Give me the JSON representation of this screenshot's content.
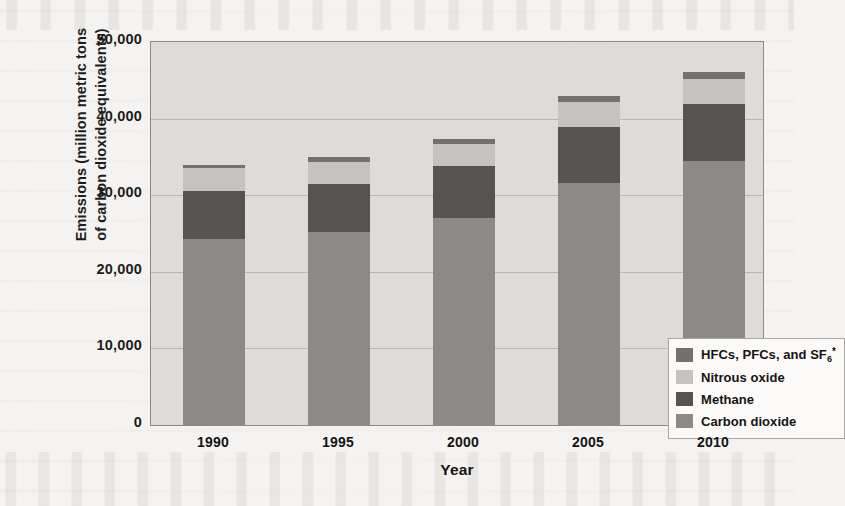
{
  "chart_data": {
    "type": "bar",
    "subtype": "stacked-bar",
    "title": "",
    "xlabel": "Year",
    "ylabel": "Emissions (million metric tons of carbon dioxide equivalents)",
    "ylabel_line1": "Emissions (million metric tons",
    "ylabel_line2": "of carbon dioxide equivalents)",
    "categories": [
      "1990",
      "1995",
      "2000",
      "2005",
      "2010"
    ],
    "ylim": [
      0,
      50000
    ],
    "yticks": [
      0,
      10000,
      20000,
      30000,
      40000,
      50000
    ],
    "ytick_labels": [
      "0",
      "10,000",
      "20,000",
      "30,000",
      "40,000",
      "50,000"
    ],
    "grid": true,
    "grid_axis": "y",
    "legend_position": "inside-lower-right",
    "stack_order_bottom_to_top": [
      "Carbon dioxide",
      "Methane",
      "Nitrous oxide",
      "HFCs, PFCs, and SF6*"
    ],
    "series": [
      {
        "name": "Carbon dioxide",
        "legend_label": "Carbon dioxide",
        "color": "#8c8a86",
        "values": [
          24300,
          25200,
          27000,
          31600,
          34500
        ]
      },
      {
        "name": "Methane",
        "legend_label": "Methane",
        "color": "#565451",
        "values": [
          6300,
          6300,
          6800,
          7300,
          7400
        ]
      },
      {
        "name": "Nitrous oxide",
        "legend_label": "Nitrous oxide",
        "color": "#c5c3bf",
        "values": [
          3000,
          2900,
          2900,
          3300,
          3300
        ]
      },
      {
        "name": "HFCs, PFCs, and SF6*",
        "legend_label": "HFCs, PFCs, and SF",
        "legend_label_sub": "6",
        "legend_label_sup": "*",
        "color": "#73716e",
        "values": [
          400,
          600,
          600,
          800,
          900
        ]
      }
    ],
    "totals": [
      34000,
      35000,
      37300,
      43000,
      46100
    ],
    "plot_background_color": "#dedcd8",
    "gridline_color": "#b9b7b3",
    "axis_border_color": "#8d8b88",
    "text_color": "#141414"
  }
}
